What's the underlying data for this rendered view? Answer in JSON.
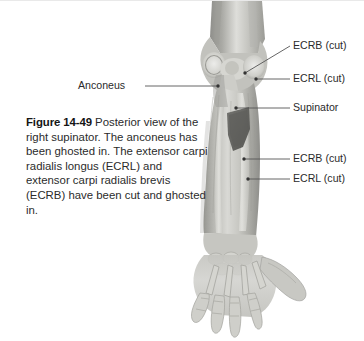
{
  "figure": {
    "number": "Figure 14-49",
    "caption": " Posterior view of the right supinator. The anconeus has been ghosted in. The extensor carpi radialis longus (ECRL) and extensor carpi radialis brevis (ECRB) have been cut and ghosted in.",
    "background_color": "#ffffff",
    "text_color": "#2b2b2b",
    "leader_color": "#555555"
  },
  "labels": {
    "ecrb_cut_proximal": "ECRB (cut)",
    "ecrl_cut_proximal": "ECRL (cut)",
    "supinator": "Supinator",
    "ecrb_cut_distal": "ECRB (cut)",
    "ecrl_cut_distal": "ECRL (cut)",
    "anconeus": "Anconeus"
  },
  "illustration": {
    "view": "posterior-right-forearm",
    "description": "Grayscale anatomical illustration: posterior view of right arm showing distal humerus, elbow joint, radius and ulna, wrist and hand skeleton with ghosted supinator, anconeus, ECRL and ECRB muscles.",
    "tones": {
      "bone_light": "#d8d8d4",
      "bone_mid": "#bdbdb8",
      "muscle_mid": "#a9a9a4",
      "muscle_dark": "#6f6f6b",
      "ghost_dark": "#595957",
      "outline": "#8e8e8a"
    }
  }
}
